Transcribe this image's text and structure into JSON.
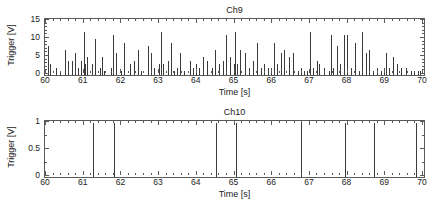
{
  "figure": {
    "background_color": "#ffffff",
    "axis_color": "#5a5a5a",
    "data_color": "#3a3a3a"
  },
  "panels": [
    {
      "id": "ch9",
      "title": "Ch9",
      "xlabel": "Time [s]",
      "ylabel": "Trigger [V]"
    },
    {
      "id": "ch10",
      "title": "Ch10",
      "xlabel": "Time [s]",
      "ylabel": "Trigger [V]"
    }
  ],
  "chart_data": [
    {
      "type": "bar",
      "id": "ch9",
      "title": "Ch9",
      "xlabel": "Time [s]",
      "ylabel": "Trigger [V]",
      "xlim": [
        60,
        70
      ],
      "ylim": [
        0,
        15
      ],
      "xticks": [
        60,
        61,
        62,
        63,
        64,
        65,
        66,
        67,
        68,
        69,
        70
      ],
      "xtick_labels": [
        "60",
        "61",
        "62",
        "63",
        "64",
        "65",
        "66",
        "67",
        "68",
        "69",
        "70"
      ],
      "yticks": [
        0,
        5,
        10,
        15
      ],
      "ytick_labels": [
        "0",
        "5",
        "10",
        "15"
      ],
      "x_minor_tick_interval": 0.2,
      "y_minor_tick_interval": 1,
      "grid": false,
      "legend": null,
      "x": [
        60.08,
        60.14,
        60.3,
        60.39,
        60.53,
        60.62,
        60.71,
        60.8,
        60.88,
        60.95,
        61.03,
        61.07,
        61.12,
        61.25,
        61.33,
        61.45,
        61.5,
        61.57,
        61.76,
        61.8,
        61.88,
        62.02,
        62.1,
        62.25,
        62.35,
        62.46,
        62.55,
        62.73,
        62.8,
        62.9,
        63.02,
        63.08,
        63.13,
        63.25,
        63.33,
        63.42,
        63.5,
        63.58,
        63.7,
        63.84,
        63.92,
        64.0,
        64.08,
        64.18,
        64.3,
        64.42,
        64.5,
        64.62,
        64.73,
        64.8,
        64.9,
        65.0,
        65.05,
        65.1,
        65.17,
        65.3,
        65.4,
        65.52,
        65.63,
        65.72,
        65.8,
        65.92,
        66.0,
        66.08,
        66.15,
        66.25,
        66.35,
        66.48,
        66.58,
        66.7,
        66.8,
        66.88,
        66.95,
        67.03,
        67.1,
        67.22,
        67.28,
        67.4,
        67.52,
        67.58,
        67.65,
        67.75,
        67.82,
        67.92,
        68.02,
        68.12,
        68.22,
        68.32,
        68.42,
        68.52,
        68.6,
        68.7,
        68.8,
        68.9,
        68.98,
        69.04,
        69.12,
        69.22,
        69.33,
        69.45,
        69.58,
        69.7,
        69.8,
        69.9,
        69.96
      ],
      "values": [
        8,
        3,
        2,
        1,
        7,
        4,
        4,
        6,
        2,
        4,
        12,
        3,
        5,
        3,
        10,
        2,
        5,
        1,
        2,
        11,
        6,
        1,
        9,
        3,
        4,
        7,
        1,
        8,
        6,
        2,
        3,
        12,
        3,
        4,
        9,
        1,
        2,
        6,
        1,
        4,
        2,
        3,
        2,
        5,
        4,
        2,
        7,
        3,
        4,
        11,
        5,
        3,
        12,
        3,
        7,
        6,
        2,
        4,
        9,
        2,
        3,
        2,
        2,
        9,
        3,
        6,
        7,
        5,
        6,
        1,
        2,
        1,
        1,
        12,
        2,
        4,
        3,
        2,
        1,
        11,
        2,
        8,
        3,
        11,
        11,
        2,
        9,
        1,
        12,
        6,
        7,
        1,
        2,
        1,
        2,
        6,
        2,
        5,
        3,
        2,
        2,
        1,
        1,
        1,
        1
      ]
    },
    {
      "type": "bar",
      "id": "ch10",
      "title": "Ch10",
      "xlabel": "Time [s]",
      "ylabel": "Trigger [V]",
      "xlim": [
        60,
        70
      ],
      "ylim": [
        0,
        1
      ],
      "xticks": [
        60,
        61,
        62,
        63,
        64,
        65,
        66,
        67,
        68,
        69,
        70
      ],
      "xtick_labels": [
        "60",
        "61",
        "62",
        "63",
        "64",
        "65",
        "66",
        "67",
        "68",
        "69",
        "70"
      ],
      "yticks": [
        0,
        0.5,
        1
      ],
      "ytick_labels": [
        "0",
        "0.5",
        "1"
      ],
      "x_minor_tick_interval": 0.2,
      "y_minor_tick_interval": 0.25,
      "grid": false,
      "legend": null,
      "x": [
        61.26,
        61.84,
        64.54,
        65.07,
        66.8,
        67.95,
        68.74,
        69.84
      ],
      "values": [
        1,
        1,
        1,
        1,
        1,
        1,
        1,
        1
      ]
    }
  ]
}
